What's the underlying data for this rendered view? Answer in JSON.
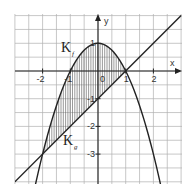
{
  "figure": {
    "axes": {
      "x_label": "x",
      "y_label": "y",
      "x_ticks": [
        {
          "value": -2,
          "label": "-2"
        },
        {
          "value": -1,
          "label": "-1"
        },
        {
          "value": 0,
          "label": "0"
        },
        {
          "value": 1,
          "label": "1"
        },
        {
          "value": 2,
          "label": "2"
        }
      ],
      "y_ticks": [
        {
          "value": 1,
          "label": "1"
        },
        {
          "value": -1,
          "label": "-1"
        },
        {
          "value": -2,
          "label": "-2"
        },
        {
          "value": -3,
          "label": "-3"
        }
      ],
      "x_range": [
        -3,
        3
      ],
      "y_range": [
        -4,
        2
      ],
      "grid_step": 0.5
    },
    "curves": [
      {
        "name": "K_f",
        "label": "K",
        "subscript": "f",
        "type": "parabola",
        "equation": "y = 1 - x^2"
      },
      {
        "name": "K_g",
        "label": "K",
        "subscript": "g",
        "type": "line",
        "equation": "y = x - 1"
      }
    ],
    "shaded_region": {
      "between": [
        "K_f",
        "K_g"
      ],
      "x_from": -2,
      "x_to": 1,
      "pattern": "vertical-hatch"
    },
    "intersections": [
      {
        "x": -2,
        "y": -3
      },
      {
        "x": 1,
        "y": 0
      }
    ],
    "colors": {
      "grid": "#b0b0b0",
      "axis": "#222222",
      "curve": "#222222",
      "hatch": "#555555"
    }
  }
}
